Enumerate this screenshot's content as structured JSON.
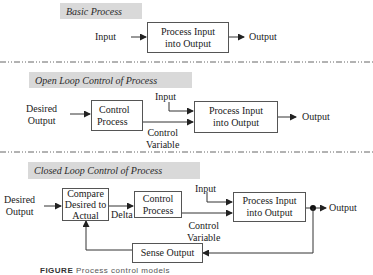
{
  "sections": {
    "basic": {
      "title": "Basic Process",
      "input_label": "Input",
      "process_box": [
        "Process Input",
        "into Output"
      ],
      "output_label": "Output"
    },
    "open_loop": {
      "title": "Open Loop Control of Process",
      "desired_output": [
        "Desired",
        "Output"
      ],
      "control_box": [
        "Control",
        "Process"
      ],
      "input_label": "Input",
      "process_box": [
        "Process Input",
        "into Output"
      ],
      "control_variable": [
        "Control",
        "Variable"
      ],
      "output_label": "Output"
    },
    "closed_loop": {
      "title": "Closed Loop Control of Process",
      "desired_output": [
        "Desired",
        "Output"
      ],
      "compare_box": [
        "Compare",
        "Desired to",
        "Actual"
      ],
      "delta_label": "Delta",
      "control_box": [
        "Control",
        "Process"
      ],
      "input_label": "Input",
      "process_box": [
        "Process Input",
        "into Output"
      ],
      "control_variable": [
        "Control",
        "Variable"
      ],
      "output_label": "Output",
      "sense_box": "Sense Output"
    }
  },
  "caption": {
    "figure_label": "FIGURE",
    "text": "Process control models"
  },
  "colors": {
    "banner_bg": "#d9d9d9",
    "line": "#333333",
    "divider": "#555555"
  }
}
